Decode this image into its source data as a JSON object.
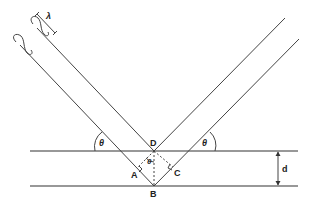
{
  "diagram": {
    "type": "bragg-diffraction",
    "labels": {
      "wavelength": "λ",
      "theta_left": "θ",
      "theta_center": "θ",
      "theta_right": "θ",
      "point_D": "D",
      "point_A": "A",
      "point_B": "B",
      "point_C": "C",
      "spacing": "d"
    },
    "colors": {
      "line": "#444444",
      "text": "#222222",
      "background": "#ffffff"
    }
  }
}
